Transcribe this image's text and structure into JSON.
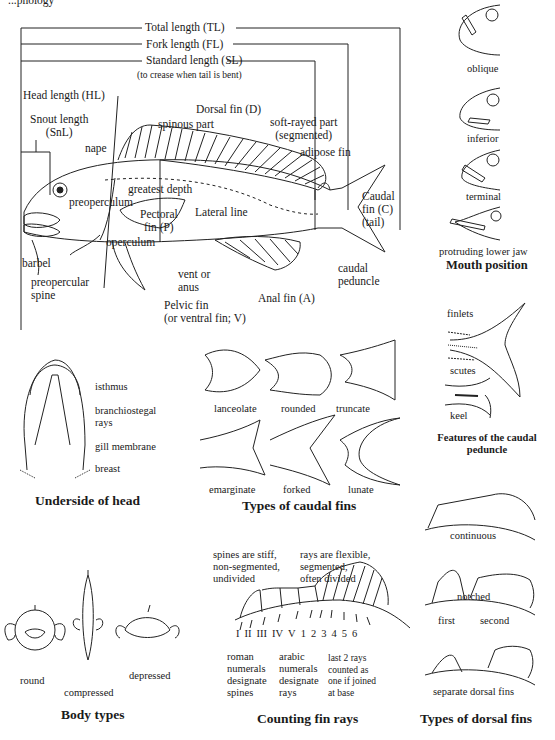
{
  "header": {
    "title_fragment": "...phology"
  },
  "main_diagram": {
    "measurements": {
      "total_length": "Total length (TL)",
      "fork_length": "Fork length (FL)",
      "standard_length": "Standard length (SL)",
      "standard_length_note": "(to crease when tail is bent)",
      "head_length": "Head length (HL)",
      "snout_length": "Snout length\n(SnL)",
      "greatest_depth": "greatest depth"
    },
    "parts": {
      "dorsal_fin": "Dorsal fin (D)",
      "spinous_part": "spinous part",
      "soft_rayed_part": "soft-rayed part\n(segmented)",
      "adipose_fin": "adipose fin",
      "nape": "nape",
      "preoperculum": "preoperculum",
      "lateral_line": "Lateral line",
      "pectoral_fin": "Pectoral\nfin (P)",
      "caudal_fin": "Caudal\nfin (C)\n(tail)",
      "operculum": "operculum",
      "barbel": "barbel",
      "preopercular_spine": "preopercular\nspine",
      "vent": "vent or\nanus",
      "pelvic_fin": "Pelvic fin\n(or ventral fin; V)",
      "anal_fin": "Anal fin (A)",
      "caudal_peduncle": "caudal\npeduncle"
    }
  },
  "mouth_position": {
    "title": "Mouth position",
    "items": [
      "oblique",
      "inferior",
      "terminal",
      "protruding lower jaw"
    ]
  },
  "caudal_peduncle_features": {
    "title": "Features of the caudal\npeduncle",
    "labels": [
      "finlets",
      "scutes",
      "keel"
    ]
  },
  "underside_of_head": {
    "title": "Underside of head",
    "labels": [
      "isthmus",
      "branchiostegal\nrays",
      "gill membrane",
      "breast"
    ]
  },
  "caudal_fin_types": {
    "title": "Types of caudal fins",
    "items": [
      "lanceolate",
      "rounded",
      "truncate",
      "emarginate",
      "forked",
      "lunate"
    ]
  },
  "body_types": {
    "title": "Body types",
    "items": [
      "round",
      "compressed",
      "depressed"
    ]
  },
  "counting_fin_rays": {
    "title": "Counting fin rays",
    "spines_note": "spines are stiff,\nnon-segmented,\nundivided",
    "rays_note": "rays are flexible,\nsegmented,\noften divided",
    "numerals": [
      "I",
      "II",
      "III",
      "IV",
      "V",
      "1",
      "2",
      "3",
      "4",
      "5",
      "6"
    ],
    "roman_note": "roman\nnumerals\ndesignate\nspines",
    "arabic_note": "arabic\nnumerals\ndesignate\nrays",
    "last_rays_note": "last 2 rays\ncounted as\none if joined\nat base"
  },
  "dorsal_fin_types": {
    "title": "Types of dorsal fins",
    "items": [
      "continuous",
      "notched",
      "separate dorsal fins"
    ],
    "separate_labels": [
      "first",
      "second"
    ]
  }
}
